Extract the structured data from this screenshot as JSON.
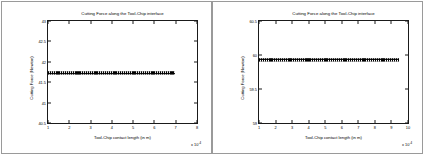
{
  "figure": {
    "panel_count": 2,
    "background_color": "#ffffff",
    "frame_color": "#9a9a9a",
    "axis_color": "#1a1a1a",
    "series_color": "#000000"
  },
  "chart_data": [
    {
      "type": "line",
      "panel": "left",
      "title": "Cutting Force along the Tool-Chip interface",
      "xlabel": "Tool-Chip contact length (in m)",
      "ylabel": "Cutting Force (Newton)",
      "x_exponent_label": "x 10",
      "x_exponent_power": "-4",
      "xlim": [
        1,
        8
      ],
      "ylim": [
        40.5,
        43
      ],
      "xticks": [
        1,
        2,
        3,
        4,
        5,
        6,
        7,
        8
      ],
      "xticklabels": [
        "1",
        "2",
        "3",
        "4",
        "5",
        "6",
        "7",
        "8"
      ],
      "yticks": [
        40.5,
        41,
        41.5,
        42,
        42.5,
        43
      ],
      "yticklabels": [
        "40.5",
        "41",
        "41.5",
        "42",
        "42.5",
        "43"
      ],
      "grid": false,
      "legend": null,
      "series": [
        {
          "name": "Cutting Force",
          "marker": "square",
          "constant_value": 41.72,
          "x_start": 1.0,
          "x_end": 6.95,
          "x": [
            1.0,
            1.2,
            1.4,
            1.6,
            1.8,
            2.0,
            2.2,
            2.4,
            2.6,
            2.8,
            3.0,
            3.2,
            3.4,
            3.6,
            3.8,
            4.0,
            4.2,
            4.4,
            4.6,
            4.8,
            5.0,
            5.2,
            5.4,
            5.6,
            5.8,
            6.0,
            6.2,
            6.4,
            6.6,
            6.8,
            6.95
          ],
          "values": [
            41.72,
            41.72,
            41.72,
            41.72,
            41.72,
            41.72,
            41.72,
            41.72,
            41.72,
            41.72,
            41.72,
            41.72,
            41.72,
            41.72,
            41.72,
            41.72,
            41.72,
            41.72,
            41.72,
            41.72,
            41.72,
            41.72,
            41.72,
            41.72,
            41.72,
            41.72,
            41.72,
            41.72,
            41.72,
            41.72,
            41.72
          ]
        }
      ]
    },
    {
      "type": "line",
      "panel": "right",
      "title": "Cutting Force along the Tool-Chip interface",
      "xlabel": "Tool-Chip contact length (in m)",
      "ylabel": "Cutting Force (Newton)",
      "x_exponent_label": "x 10",
      "x_exponent_power": "-4",
      "xlim": [
        1,
        10
      ],
      "ylim": [
        59,
        60.5
      ],
      "xticks": [
        1,
        2,
        3,
        4,
        5,
        6,
        7,
        8,
        9,
        10
      ],
      "xticklabels": [
        "1",
        "2",
        "3",
        "4",
        "5",
        "6",
        "7",
        "8",
        "9",
        "10"
      ],
      "yticks": [
        59,
        59.5,
        60,
        60.5
      ],
      "yticklabels": [
        "59",
        "59.5",
        "60",
        "60.5"
      ],
      "grid": false,
      "legend": null,
      "series": [
        {
          "name": "Cutting Force",
          "marker": "square",
          "constant_value": 59.93,
          "x_start": 1.0,
          "x_end": 9.45,
          "x": [
            1.0,
            1.3,
            1.6,
            1.9,
            2.2,
            2.5,
            2.8,
            3.1,
            3.4,
            3.7,
            4.0,
            4.3,
            4.6,
            4.9,
            5.2,
            5.5,
            5.8,
            6.1,
            6.4,
            6.7,
            7.0,
            7.3,
            7.6,
            7.9,
            8.2,
            8.5,
            8.8,
            9.1,
            9.45
          ],
          "values": [
            59.93,
            59.93,
            59.93,
            59.93,
            59.93,
            59.93,
            59.93,
            59.93,
            59.93,
            59.93,
            59.93,
            59.93,
            59.93,
            59.93,
            59.93,
            59.93,
            59.93,
            59.93,
            59.93,
            59.93,
            59.93,
            59.93,
            59.93,
            59.93,
            59.93,
            59.93,
            59.93,
            59.93,
            59.93
          ]
        }
      ]
    }
  ]
}
